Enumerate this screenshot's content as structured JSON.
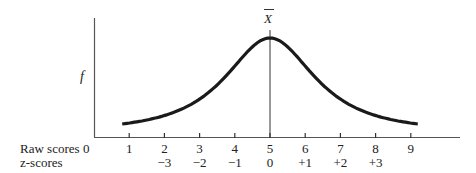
{
  "chart_data": {
    "type": "line",
    "title": "",
    "subtitle": "",
    "ylabel": "f",
    "xlabel": "",
    "mean_label": "X̄",
    "mean_at_raw": 5,
    "grid": false,
    "legend": null,
    "axis_rows": [
      {
        "label": "Raw scores",
        "origin_label": "0",
        "ticks": [
          "1",
          "2",
          "3",
          "4",
          "5",
          "6",
          "7",
          "8",
          "9"
        ]
      },
      {
        "label": "z-scores",
        "ticks": [
          "",
          "−3",
          "−2",
          "−1",
          "0",
          "+1",
          "+2",
          "+3",
          ""
        ]
      }
    ],
    "x": [
      1,
      2,
      3,
      4,
      5,
      6,
      7,
      8,
      9
    ],
    "z": [
      null,
      -3,
      -2,
      -1,
      0,
      1,
      2,
      3,
      null
    ],
    "xlim": [
      0,
      10
    ],
    "curve_range_raw": [
      0.8,
      9.2
    ],
    "series": [
      {
        "name": "frequency",
        "shape": "normal",
        "mean": 5,
        "sd": 1
      }
    ]
  },
  "labels": {
    "y_axis": "f",
    "mean": "X",
    "raw_row": "Raw scores",
    "z_row": "z-scores",
    "origin": "0"
  }
}
